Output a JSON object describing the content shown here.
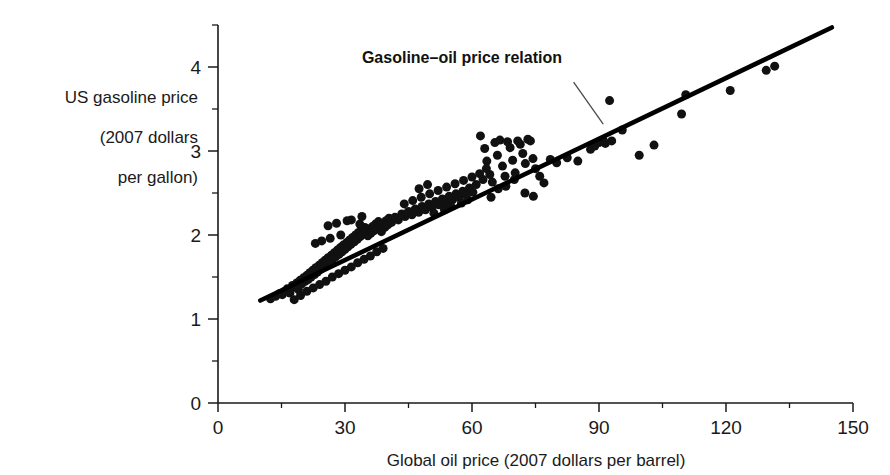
{
  "chart_data": {
    "type": "scatter",
    "title": "",
    "xlabel": "Global oil price (2007 dollars per barrel)",
    "ylabel": "US gasoline price (2007 dollars per gallon)",
    "ylabel_lines": [
      "US gasoline price",
      "(2007 dollars",
      "per gallon)"
    ],
    "xlim": [
      0,
      150
    ],
    "ylim": [
      0,
      4.5
    ],
    "xticks": [
      0,
      30,
      60,
      90,
      120,
      150
    ],
    "xticklabels": [
      "0",
      "30",
      "60",
      "90",
      "120",
      "150"
    ],
    "xminorticks": [
      15,
      45,
      75,
      105,
      135
    ],
    "yticks": [
      0,
      1,
      2,
      3,
      4
    ],
    "yticklabels": [
      "0",
      "1",
      "2",
      "3",
      "4"
    ],
    "yminorticks": [
      0.5,
      1.5,
      2.5,
      3.5,
      4.5
    ],
    "grid": false,
    "legend": "none",
    "marker": "filled-circle",
    "marker_color": "#111111",
    "annotations": [
      {
        "text": "Gasoline–oil price relation",
        "x": 34,
        "y": 4.05,
        "leader_from": [
          84,
          3.82
        ],
        "leader_to": [
          91,
          3.32
        ]
      }
    ],
    "series": [
      {
        "name": "Gasoline–oil price relation",
        "type": "line",
        "color": "#000000",
        "x": [
          10,
          145
        ],
        "y": [
          1.22,
          4.47
        ]
      },
      {
        "name": "Monthly observations",
        "type": "scatter",
        "color": "#111111",
        "points": [
          [
            12.4,
            1.24
          ],
          [
            13.6,
            1.27
          ],
          [
            14.5,
            1.3
          ],
          [
            15.2,
            1.29
          ],
          [
            15.8,
            1.33
          ],
          [
            16.4,
            1.36
          ],
          [
            17.0,
            1.31
          ],
          [
            17.6,
            1.4
          ],
          [
            18.1,
            1.38
          ],
          [
            18.6,
            1.43
          ],
          [
            19.0,
            1.35
          ],
          [
            19.4,
            1.46
          ],
          [
            19.8,
            1.42
          ],
          [
            20.2,
            1.49
          ],
          [
            20.6,
            1.45
          ],
          [
            21.0,
            1.52
          ],
          [
            21.3,
            1.47
          ],
          [
            21.7,
            1.55
          ],
          [
            22.0,
            1.5
          ],
          [
            22.4,
            1.58
          ],
          [
            22.8,
            1.53
          ],
          [
            23.1,
            1.61
          ],
          [
            23.5,
            1.56
          ],
          [
            23.9,
            1.64
          ],
          [
            24.2,
            1.59
          ],
          [
            24.6,
            1.67
          ],
          [
            25.0,
            1.62
          ],
          [
            25.3,
            1.7
          ],
          [
            25.7,
            1.65
          ],
          [
            26.0,
            1.73
          ],
          [
            26.4,
            1.68
          ],
          [
            26.8,
            1.76
          ],
          [
            27.1,
            1.71
          ],
          [
            27.5,
            1.79
          ],
          [
            27.8,
            1.74
          ],
          [
            28.2,
            1.82
          ],
          [
            28.6,
            1.77
          ],
          [
            28.9,
            1.85
          ],
          [
            29.3,
            1.8
          ],
          [
            29.6,
            1.88
          ],
          [
            30.0,
            1.83
          ],
          [
            30.4,
            1.91
          ],
          [
            30.7,
            1.86
          ],
          [
            31.1,
            1.94
          ],
          [
            31.4,
            1.89
          ],
          [
            31.8,
            1.97
          ],
          [
            32.2,
            1.92
          ],
          [
            32.5,
            2.0
          ],
          [
            32.9,
            1.95
          ],
          [
            33.2,
            2.03
          ],
          [
            33.6,
            1.98
          ],
          [
            34.0,
            2.06
          ],
          [
            34.3,
            2.01
          ],
          [
            34.7,
            2.09
          ],
          [
            35.0,
            2.04
          ],
          [
            35.4,
            1.99
          ],
          [
            35.8,
            2.07
          ],
          [
            36.1,
            2.02
          ],
          [
            36.5,
            2.1
          ],
          [
            36.8,
            2.05
          ],
          [
            37.2,
            2.13
          ],
          [
            37.6,
            2.08
          ],
          [
            37.9,
            2.16
          ],
          [
            38.3,
            2.11
          ],
          [
            38.6,
            2.04
          ],
          [
            39.0,
            2.14
          ],
          [
            39.4,
            2.09
          ],
          [
            39.7,
            2.17
          ],
          [
            40.1,
            2.12
          ],
          [
            40.4,
            2.2
          ],
          [
            18.0,
            1.23
          ],
          [
            19.5,
            1.28
          ],
          [
            21.0,
            1.33
          ],
          [
            22.5,
            1.37
          ],
          [
            24.0,
            1.41
          ],
          [
            25.5,
            1.45
          ],
          [
            27.0,
            1.5
          ],
          [
            28.5,
            1.54
          ],
          [
            30.0,
            1.58
          ],
          [
            31.5,
            1.62
          ],
          [
            33.0,
            1.67
          ],
          [
            34.5,
            1.71
          ],
          [
            36.0,
            1.75
          ],
          [
            37.5,
            1.8
          ],
          [
            39.0,
            1.84
          ],
          [
            26.0,
            2.11
          ],
          [
            28.0,
            2.14
          ],
          [
            31.5,
            2.18
          ],
          [
            34.0,
            2.22
          ],
          [
            30.5,
            2.17
          ],
          [
            23.0,
            1.9
          ],
          [
            24.5,
            1.93
          ],
          [
            26.5,
            1.96
          ],
          [
            29.0,
            2.0
          ],
          [
            33.5,
            2.13
          ],
          [
            41.0,
            2.15
          ],
          [
            41.8,
            2.21
          ],
          [
            42.6,
            2.18
          ],
          [
            43.4,
            2.25
          ],
          [
            44.2,
            2.22
          ],
          [
            45.0,
            2.28
          ],
          [
            45.8,
            2.24
          ],
          [
            46.6,
            2.31
          ],
          [
            47.4,
            2.27
          ],
          [
            48.2,
            2.34
          ],
          [
            49.0,
            2.3
          ],
          [
            49.8,
            2.37
          ],
          [
            50.6,
            2.33
          ],
          [
            51.4,
            2.4
          ],
          [
            52.2,
            2.36
          ],
          [
            53.0,
            2.43
          ],
          [
            53.8,
            2.39
          ],
          [
            54.6,
            2.46
          ],
          [
            55.4,
            2.42
          ],
          [
            56.2,
            2.49
          ],
          [
            57.0,
            2.45
          ],
          [
            57.8,
            2.52
          ],
          [
            58.6,
            2.48
          ],
          [
            59.4,
            2.56
          ],
          [
            60.2,
            2.51
          ],
          [
            44.0,
            2.37
          ],
          [
            46.0,
            2.41
          ],
          [
            48.0,
            2.45
          ],
          [
            50.0,
            2.49
          ],
          [
            52.0,
            2.53
          ],
          [
            54.0,
            2.57
          ],
          [
            56.0,
            2.61
          ],
          [
            58.0,
            2.65
          ],
          [
            60.0,
            2.69
          ],
          [
            55.0,
            2.34
          ],
          [
            57.5,
            2.38
          ],
          [
            59.0,
            2.42
          ],
          [
            53.5,
            2.3
          ],
          [
            51.0,
            2.26
          ],
          [
            47.5,
            2.55
          ],
          [
            49.5,
            2.6
          ],
          [
            61.0,
            2.6
          ],
          [
            61.8,
            2.73
          ],
          [
            62.6,
            2.66
          ],
          [
            63.4,
            2.79
          ],
          [
            62.0,
            3.18
          ],
          [
            63.0,
            3.03
          ],
          [
            63.5,
            2.88
          ],
          [
            64.2,
            2.72
          ],
          [
            64.8,
            2.63
          ],
          [
            65.4,
            3.1
          ],
          [
            66.0,
            2.95
          ],
          [
            66.6,
            3.13
          ],
          [
            67.2,
            2.82
          ],
          [
            67.8,
            2.7
          ],
          [
            68.4,
            3.11
          ],
          [
            69.0,
            3.04
          ],
          [
            69.6,
            2.89
          ],
          [
            70.2,
            2.74
          ],
          [
            70.8,
            3.12
          ],
          [
            71.4,
            3.08
          ],
          [
            72.0,
            2.97
          ],
          [
            72.6,
            2.85
          ],
          [
            73.2,
            3.14
          ],
          [
            73.8,
            3.12
          ],
          [
            74.4,
            2.91
          ],
          [
            75.0,
            2.79
          ],
          [
            76.0,
            2.7
          ],
          [
            77.0,
            2.62
          ],
          [
            64.5,
            2.45
          ],
          [
            66.2,
            2.55
          ],
          [
            68.0,
            2.58
          ],
          [
            70.0,
            2.66
          ],
          [
            72.5,
            2.5
          ],
          [
            74.5,
            2.46
          ],
          [
            78.5,
            2.9
          ],
          [
            80.0,
            2.86
          ],
          [
            82.5,
            2.92
          ],
          [
            85.0,
            2.88
          ],
          [
            88.0,
            3.02
          ],
          [
            89.0,
            3.06
          ],
          [
            90.0,
            3.1
          ],
          [
            91.0,
            3.13
          ],
          [
            91.5,
            3.09
          ],
          [
            92.5,
            3.6
          ],
          [
            93.0,
            3.12
          ],
          [
            95.5,
            3.25
          ],
          [
            99.5,
            2.95
          ],
          [
            103.0,
            3.07
          ],
          [
            109.5,
            3.44
          ],
          [
            110.5,
            3.67
          ],
          [
            121.0,
            3.72
          ],
          [
            129.5,
            3.96
          ],
          [
            131.5,
            4.01
          ]
        ]
      }
    ]
  }
}
